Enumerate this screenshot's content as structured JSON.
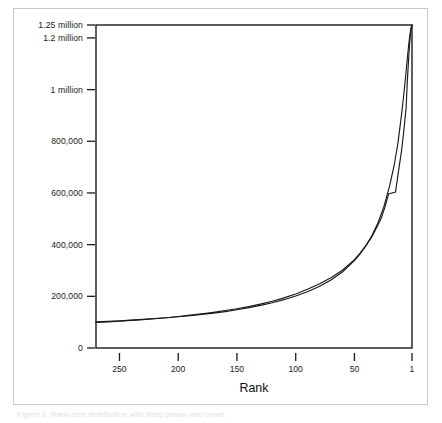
{
  "figure": {
    "caption": "Figure 1. Rank-size distribution with fitted power-law curve.",
    "background_color": "#ffffff",
    "border_color": "#c9c9c9",
    "axis_color": "#1a1a1a"
  },
  "chart_data": {
    "type": "line",
    "title": "",
    "subtitle": "",
    "xlabel": "Rank",
    "ylabel": "",
    "grid": false,
    "legend": "none",
    "x_axis_reversed": true,
    "xlim": [
      270,
      1
    ],
    "ylim": [
      0,
      1250000
    ],
    "x_ticks": [
      250,
      200,
      150,
      100,
      50,
      1
    ],
    "x_tick_labels": [
      "250",
      "200",
      "150",
      "100",
      "50",
      "1"
    ],
    "y_ticks": [
      0,
      200000,
      400000,
      600000,
      800000,
      1000000,
      1200000,
      1250000
    ],
    "y_tick_labels": [
      "0",
      "200,000",
      "400,000",
      "600,000",
      "800,000",
      "1 million",
      "1.2 million",
      "1.25 million"
    ],
    "series": [
      {
        "name": "fitted-curve",
        "style": "smooth",
        "color": "#1a1a1a",
        "x": [
          270,
          260,
          250,
          240,
          230,
          220,
          210,
          200,
          190,
          180,
          170,
          160,
          150,
          140,
          130,
          120,
          110,
          100,
          90,
          80,
          70,
          60,
          50,
          45,
          40,
          35,
          30,
          25,
          20,
          16,
          13,
          10,
          8,
          6,
          5,
          4,
          3,
          2,
          1
        ],
        "values": [
          101000,
          103000,
          105000,
          108000,
          111000,
          114000,
          117000,
          121000,
          125000,
          130000,
          135000,
          141000,
          148000,
          156000,
          165000,
          175000,
          187000,
          201000,
          218000,
          238000,
          263000,
          295000,
          338000,
          365000,
          397000,
          436000,
          484000,
          546000,
          628000,
          712000,
          792000,
          900000,
          980000,
          1070000,
          1120000,
          1165000,
          1205000,
          1235000,
          1250000
        ]
      },
      {
        "name": "empirical-curve",
        "style": "jagged",
        "color": "#1a1a1a",
        "x": [
          270,
          260,
          250,
          240,
          230,
          220,
          210,
          200,
          190,
          180,
          170,
          160,
          150,
          140,
          130,
          120,
          110,
          100,
          90,
          80,
          70,
          60,
          50,
          45,
          40,
          35,
          30,
          27,
          24,
          21,
          18,
          15,
          12,
          10,
          8,
          6,
          5,
          4,
          3,
          2,
          1
        ],
        "values": [
          99000,
          101000,
          104000,
          107000,
          110000,
          113000,
          117000,
          122000,
          127000,
          132000,
          138000,
          145000,
          152000,
          160000,
          170000,
          181000,
          194000,
          209000,
          227000,
          248000,
          272000,
          302000,
          342000,
          368000,
          398000,
          432000,
          476000,
          505000,
          546000,
          596000,
          600000,
          604000,
          700000,
          760000,
          840000,
          930000,
          1030000,
          1110000,
          1180000,
          1230000,
          1250000
        ]
      }
    ]
  }
}
